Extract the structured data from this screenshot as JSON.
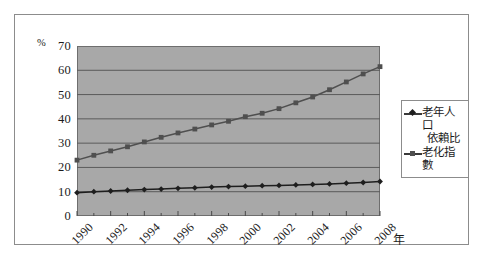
{
  "chart_data": {
    "type": "line",
    "title": "",
    "xlabel": "年",
    "ylabel": "%",
    "ylim": [
      0,
      70
    ],
    "ytick_step": 10,
    "yticks": [
      "70",
      "60",
      "50",
      "40",
      "30",
      "20",
      "10",
      "0"
    ],
    "grid": true,
    "legend_position": "right",
    "x": [
      1990,
      1991,
      1992,
      1993,
      1994,
      1995,
      1996,
      1997,
      1998,
      1999,
      2000,
      2001,
      2002,
      2003,
      2004,
      2005,
      2006,
      2007,
      2008
    ],
    "xtick_labels": [
      "1990",
      "1992",
      "1994",
      "1996",
      "1998",
      "2000",
      "2002",
      "2004",
      "2006",
      "2008"
    ],
    "series": [
      {
        "name": "老年人口依賴比",
        "name_line1": "老年人口",
        "name_line2": "依賴比",
        "marker": "diamond",
        "color": "#1e1e1e",
        "values": [
          9.6,
          10.0,
          10.3,
          10.6,
          10.9,
          11.1,
          11.4,
          11.6,
          11.9,
          12.1,
          12.3,
          12.5,
          12.6,
          12.8,
          13.0,
          13.2,
          13.5,
          13.8,
          14.2
        ]
      },
      {
        "name": "老化指數",
        "name_line1": "老化指數",
        "name_line2": "",
        "marker": "square",
        "color": "#4f4f4f",
        "values": [
          23.0,
          25.0,
          26.8,
          28.5,
          30.5,
          32.4,
          34.2,
          35.8,
          37.5,
          39.0,
          40.9,
          42.3,
          44.2,
          46.6,
          49.0,
          52.0,
          55.2,
          58.5,
          61.5
        ]
      }
    ],
    "plot_bg_color": "#a8a8a8",
    "frame_border_color": "#8c8c8c",
    "grid_line_color": "#5a5a5a"
  }
}
